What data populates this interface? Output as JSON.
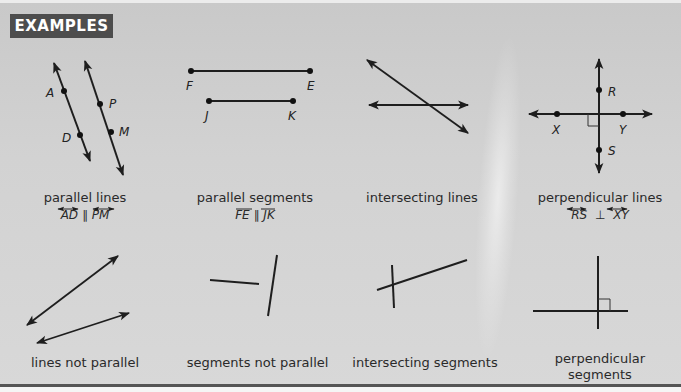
{
  "header": {
    "title": "EXAMPLES"
  },
  "colors": {
    "background": "#d0d0d0",
    "header_bg": "#4d4d4d",
    "header_text": "#ffffff",
    "ink": "#222222",
    "rule": "#555555"
  },
  "examples": [
    {
      "caption": "parallel lines",
      "notation": {
        "left": "AD",
        "op": "∥",
        "right": "PM",
        "mark": "line"
      },
      "points": [
        "A",
        "D",
        "P",
        "M"
      ]
    },
    {
      "caption": "parallel segments",
      "notation": {
        "left": "FE",
        "op": "∥",
        "right": "JK",
        "mark": "segment"
      },
      "points": [
        "F",
        "E",
        "J",
        "K"
      ]
    },
    {
      "caption": "intersecting lines"
    },
    {
      "caption": "perpendicular lines",
      "notation": {
        "left": "RS",
        "op": "⊥",
        "right": "XY",
        "mark": "line"
      },
      "points": [
        "R",
        "S",
        "X",
        "Y"
      ]
    },
    {
      "caption": "lines not parallel"
    },
    {
      "caption": "segments not parallel"
    },
    {
      "caption": "intersecting segments"
    },
    {
      "caption_line1": "perpendicular",
      "caption_line2": "segments"
    }
  ]
}
